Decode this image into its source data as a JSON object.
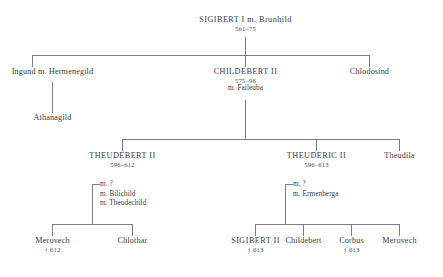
{
  "diagram": {
    "type": "genealogical-tree",
    "title_node": "SIGIBERT I m. Brunhild",
    "line_color": "#6c6f80",
    "text_color": "#3a3a42"
  },
  "nodes": {
    "sigibert_i": {
      "name": "SIGIBERT I  m.  Brunhild",
      "dates": "561–75"
    },
    "ingund": {
      "name": "Ingund m. Hermenegild"
    },
    "childebert_ii": {
      "name": "CHILDEBERT II",
      "dates": "575–96",
      "spouse": "m. Faileuba"
    },
    "chlodosind": {
      "name": "Chlodosind"
    },
    "athanagild": {
      "name": "Athanagild"
    },
    "theudebert_ii": {
      "name": "THEUDEBERT II",
      "dates": "596–612",
      "marriages": [
        "m. ?",
        "m. Bilichild",
        "m. Theudechild"
      ]
    },
    "theuderic_ii": {
      "name": "THEUDERIC II",
      "dates": "596–613",
      "marriages": [
        "m. ?",
        "m. Ermenberga"
      ]
    },
    "theudila": {
      "name": "Theudila"
    },
    "merovech_left": {
      "name": "Merovech",
      "death": "† 612"
    },
    "chlothar": {
      "name": "Chlothar"
    },
    "sigibert_ii": {
      "name": "SIGIBERT II",
      "death": "† 613"
    },
    "childebert_child": {
      "name": "Childebert"
    },
    "corbus": {
      "name": "Corbus",
      "death": "† 613"
    },
    "merovech_right": {
      "name": "Merovech"
    }
  }
}
